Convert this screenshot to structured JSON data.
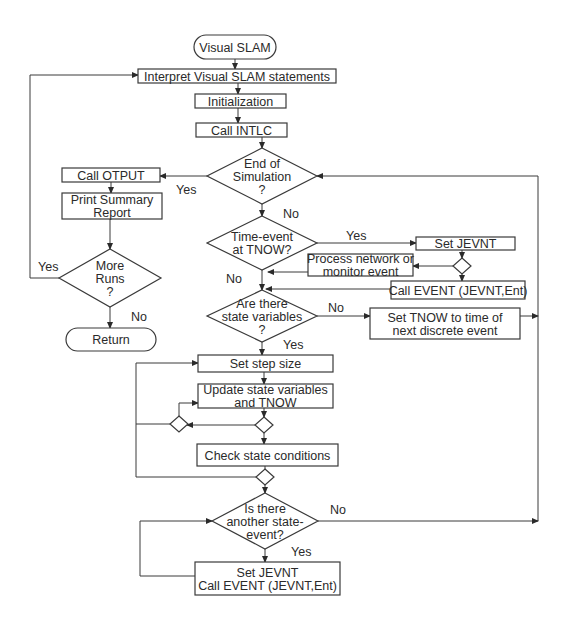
{
  "diagram": {
    "title": "Visual SLAM",
    "colors": {
      "stroke": "#3a3a3a",
      "text": "#2a2a2a",
      "background": "#ffffff"
    },
    "terminals": [
      {
        "id": "start",
        "label": "Visual SLAM",
        "x": 194,
        "y": 35,
        "w": 82,
        "h": 24
      },
      {
        "id": "return",
        "label": "Return",
        "x": 66,
        "y": 328,
        "w": 90,
        "h": 23
      }
    ],
    "processes": [
      {
        "id": "interpret",
        "lines": [
          "Interpret Visual SLAM statements"
        ],
        "x": 138,
        "y": 69,
        "w": 198,
        "h": 14
      },
      {
        "id": "init",
        "lines": [
          "Initialization"
        ],
        "x": 195,
        "y": 94,
        "w": 91,
        "h": 14
      },
      {
        "id": "intlc",
        "lines": [
          "Call INTLC"
        ],
        "x": 196,
        "y": 123,
        "w": 91,
        "h": 14
      },
      {
        "id": "otput",
        "lines": [
          "Call OTPUT"
        ],
        "x": 62,
        "y": 168,
        "w": 98,
        "h": 14
      },
      {
        "id": "summary",
        "lines": [
          "Print Summary",
          "Report"
        ],
        "x": 62,
        "y": 193,
        "w": 100,
        "h": 26
      },
      {
        "id": "setjevnt",
        "lines": [
          "Set JEVNT"
        ],
        "x": 416,
        "y": 237,
        "w": 99,
        "h": 13
      },
      {
        "id": "process",
        "lines": [
          "Process network or",
          "monitor event"
        ],
        "x": 308,
        "y": 254,
        "w": 105,
        "h": 22
      },
      {
        "id": "callevent",
        "lines": [
          "Call EVENT (JEVNT,Ent)"
        ],
        "x": 391,
        "y": 281,
        "w": 134,
        "h": 18
      },
      {
        "id": "settnow",
        "lines": [
          "Set TNOW to time of",
          "next discrete event"
        ],
        "x": 370,
        "y": 308,
        "w": 150,
        "h": 31
      },
      {
        "id": "stepsize",
        "lines": [
          "Set step size"
        ],
        "x": 198,
        "y": 355,
        "w": 135,
        "h": 17
      },
      {
        "id": "update",
        "lines": [
          "Update state variables",
          "and TNOW"
        ],
        "x": 198,
        "y": 384,
        "w": 135,
        "h": 24
      },
      {
        "id": "check",
        "lines": [
          "Check state conditions"
        ],
        "x": 197,
        "y": 444,
        "w": 141,
        "h": 22
      },
      {
        "id": "setjevnt2",
        "lines": [
          "Set JEVNT",
          "Call EVENT (JEVNT,Ent)"
        ],
        "x": 195,
        "y": 562,
        "w": 145,
        "h": 33
      }
    ],
    "decisions": [
      {
        "id": "endsim",
        "lines": [
          "End of",
          "Simulation",
          "?"
        ],
        "cx": 262,
        "cy": 176,
        "hw": 55,
        "hh": 28
      },
      {
        "id": "timeevent",
        "lines": [
          "Time-event",
          "at TNOW?"
        ],
        "cx": 262,
        "cy": 243,
        "hw": 55,
        "hh": 27
      },
      {
        "id": "morerun",
        "lines": [
          "More",
          "Runs",
          "?"
        ],
        "cx": 110,
        "cy": 278,
        "hw": 51,
        "hh": 29
      },
      {
        "id": "statevars",
        "lines": [
          "Are there",
          "state variables",
          "?"
        ],
        "cx": 262,
        "cy": 316,
        "hw": 55,
        "hh": 26
      },
      {
        "id": "another",
        "lines": [
          "Is there",
          "another state-",
          "event?"
        ],
        "cx": 265,
        "cy": 521,
        "hw": 53,
        "hh": 28
      }
    ],
    "junctions": [
      {
        "id": "j1",
        "cx": 462,
        "cy": 266,
        "r": 8
      },
      {
        "id": "j2",
        "cx": 264,
        "cy": 425,
        "r": 8
      },
      {
        "id": "j3",
        "cx": 179,
        "cy": 424,
        "r": 8
      },
      {
        "id": "j4",
        "cx": 265,
        "cy": 477,
        "r": 8
      }
    ],
    "edge_labels": [
      {
        "text": "Yes",
        "x": 176,
        "y": 194
      },
      {
        "text": "No",
        "x": 283,
        "y": 218
      },
      {
        "text": "Yes",
        "x": 346,
        "y": 240
      },
      {
        "text": "No",
        "x": 226,
        "y": 283
      },
      {
        "text": "No",
        "x": 328,
        "y": 312
      },
      {
        "text": "Yes",
        "x": 283,
        "y": 349
      },
      {
        "text": "Yes",
        "x": 38,
        "y": 271
      },
      {
        "text": "No",
        "x": 131,
        "y": 321
      },
      {
        "text": "No",
        "x": 330,
        "y": 514
      },
      {
        "text": "Yes",
        "x": 291,
        "y": 556
      }
    ],
    "connectors": [
      {
        "pts": [
          [
            235,
            59
          ],
          [
            235,
            69
          ]
        ],
        "arrow": true
      },
      {
        "pts": [
          [
            238,
            83
          ],
          [
            238,
            94
          ]
        ],
        "arrow": true
      },
      {
        "pts": [
          [
            238,
            108
          ],
          [
            238,
            123
          ]
        ],
        "arrow": true
      },
      {
        "pts": [
          [
            262,
            137
          ],
          [
            262,
            148
          ]
        ],
        "arrow": true
      },
      {
        "pts": [
          [
            207,
            176
          ],
          [
            160,
            176
          ]
        ],
        "arrow": true
      },
      {
        "pts": [
          [
            111,
            182
          ],
          [
            111,
            193
          ]
        ],
        "arrow": true
      },
      {
        "pts": [
          [
            110,
            219
          ],
          [
            110,
            249
          ]
        ],
        "arrow": true
      },
      {
        "pts": [
          [
            110,
            307
          ],
          [
            110,
            328
          ]
        ],
        "arrow": true
      },
      {
        "pts": [
          [
            59,
            278
          ],
          [
            30,
            278
          ],
          [
            30,
            75
          ],
          [
            138,
            75
          ]
        ],
        "arrow": true
      },
      {
        "pts": [
          [
            262,
            204
          ],
          [
            262,
            216
          ]
        ],
        "arrow": true
      },
      {
        "pts": [
          [
            317,
            243
          ],
          [
            416,
            243
          ]
        ],
        "arrow": true
      },
      {
        "pts": [
          [
            462,
            250
          ],
          [
            462,
            258
          ]
        ],
        "arrow": true
      },
      {
        "pts": [
          [
            454,
            266
          ],
          [
            413,
            266
          ]
        ],
        "arrow": true
      },
      {
        "pts": [
          [
            462,
            274
          ],
          [
            462,
            281
          ]
        ],
        "arrow": true
      },
      {
        "pts": [
          [
            308,
            272
          ],
          [
            268,
            272
          ]
        ],
        "arrow": true
      },
      {
        "pts": [
          [
            391,
            289
          ],
          [
            266,
            289
          ]
        ],
        "arrow": true
      },
      {
        "pts": [
          [
            262,
            270
          ],
          [
            262,
            290
          ]
        ],
        "arrow": true
      },
      {
        "pts": [
          [
            317,
            316
          ],
          [
            370,
            316
          ]
        ],
        "arrow": true
      },
      {
        "pts": [
          [
            520,
            316
          ],
          [
            538,
            316
          ]
        ],
        "arrow": true
      },
      {
        "pts": [
          [
            538,
            521
          ],
          [
            538,
            176
          ],
          [
            317,
            176
          ]
        ],
        "arrow": true
      },
      {
        "pts": [
          [
            262,
            342
          ],
          [
            262,
            355
          ]
        ],
        "arrow": true
      },
      {
        "pts": [
          [
            264,
            372
          ],
          [
            264,
            384
          ]
        ],
        "arrow": true
      },
      {
        "pts": [
          [
            264,
            408
          ],
          [
            264,
            417
          ]
        ],
        "arrow": true
      },
      {
        "pts": [
          [
            256,
            425
          ],
          [
            187,
            425
          ]
        ],
        "arrow": true
      },
      {
        "pts": [
          [
            179,
            416
          ],
          [
            179,
            403
          ],
          [
            198,
            403
          ]
        ],
        "arrow": true
      },
      {
        "pts": [
          [
            171,
            424
          ],
          [
            136,
            424
          ]
        ],
        "arrow": false
      },
      {
        "pts": [
          [
            136,
            477
          ],
          [
            136,
            363
          ],
          [
            198,
            363
          ]
        ],
        "arrow": true
      },
      {
        "pts": [
          [
            264,
            433
          ],
          [
            264,
            444
          ]
        ],
        "arrow": true
      },
      {
        "pts": [
          [
            265,
            466
          ],
          [
            265,
            469
          ]
        ],
        "arrow": false
      },
      {
        "pts": [
          [
            257,
            477
          ],
          [
            136,
            477
          ]
        ],
        "arrow": false
      },
      {
        "pts": [
          [
            265,
            485
          ],
          [
            265,
            493
          ]
        ],
        "arrow": true
      },
      {
        "pts": [
          [
            318,
            521
          ],
          [
            538,
            521
          ]
        ],
        "arrow": true
      },
      {
        "pts": [
          [
            265,
            549
          ],
          [
            265,
            562
          ]
        ],
        "arrow": true
      },
      {
        "pts": [
          [
            195,
            576
          ],
          [
            140,
            576
          ],
          [
            140,
            521
          ],
          [
            212,
            521
          ]
        ],
        "arrow": true
      }
    ]
  }
}
